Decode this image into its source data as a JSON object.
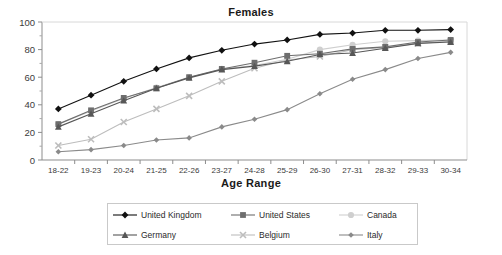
{
  "chart_data": {
    "type": "line",
    "title": "Females",
    "xlabel": "Age Range",
    "ylabel": "",
    "ylim": [
      0,
      100
    ],
    "yticks": [
      0,
      20,
      40,
      60,
      80,
      100
    ],
    "grid": false,
    "legend_position": "bottom",
    "categories": [
      "18-22",
      "19-23",
      "20-24",
      "21-25",
      "22-26",
      "23-27",
      "24-28",
      "25-29",
      "26-30",
      "27-31",
      "28-32",
      "29-33",
      "30-34"
    ],
    "series": [
      {
        "name": "United Kingdom",
        "color": "#111111",
        "marker": "diamond",
        "values": [
          37,
          47,
          57,
          66,
          74,
          79.5,
          84,
          87,
          91,
          92,
          94,
          94,
          94.5
        ]
      },
      {
        "name": "United States",
        "color": "#6e6e6e",
        "marker": "square",
        "values": [
          26,
          36,
          45,
          52,
          60,
          66,
          70.5,
          75.5,
          77,
          80.5,
          82,
          85.5,
          87
        ]
      },
      {
        "name": "Canada",
        "color": "#cfcfcf",
        "marker": "circle",
        "values": [
          26,
          35.5,
          44.5,
          52.5,
          60,
          66,
          68.5,
          73,
          80,
          83.5,
          86,
          86.5,
          87
        ]
      },
      {
        "name": "Germany",
        "color": "#575757",
        "marker": "triangle",
        "values": [
          24,
          33.5,
          43,
          52,
          59.5,
          65.5,
          68,
          71.5,
          76.5,
          77.5,
          81,
          84.5,
          85.5
        ]
      },
      {
        "name": "Belgium",
        "color": "#bdbdbd",
        "marker": "x",
        "values": [
          10.5,
          15,
          27.5,
          37,
          46.5,
          57,
          66.5,
          72.5,
          75,
          80,
          81.5,
          84.5,
          86
        ]
      },
      {
        "name": "Italy",
        "color": "#8a8a8a",
        "marker": "small-diamond",
        "values": [
          6,
          7.5,
          10.5,
          14.5,
          16,
          24,
          29.5,
          36.5,
          48,
          58.5,
          65.5,
          73.5,
          78
        ]
      }
    ]
  },
  "legend": {
    "items": [
      {
        "label": "United Kingdom"
      },
      {
        "label": "United States"
      },
      {
        "label": "Canada"
      },
      {
        "label": "Germany"
      },
      {
        "label": "Belgium"
      },
      {
        "label": "Italy"
      }
    ]
  }
}
